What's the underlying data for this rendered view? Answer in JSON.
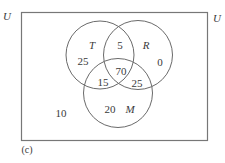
{
  "universe": {
    "label": "U",
    "label_right": "U",
    "outside_count": "10"
  },
  "sets": {
    "T": {
      "label": "T",
      "only": "25"
    },
    "R": {
      "label": "R",
      "only": "0"
    },
    "M": {
      "label": "M",
      "only": "20"
    }
  },
  "intersections": {
    "T_R_only": "5",
    "T_M_only": "15",
    "R_M_only": "25",
    "T_R_M": "70"
  },
  "caption": "(c)",
  "colors": {
    "stroke": "#6a6a6a",
    "text": "#3a3a3a",
    "background": "#ffffff"
  }
}
